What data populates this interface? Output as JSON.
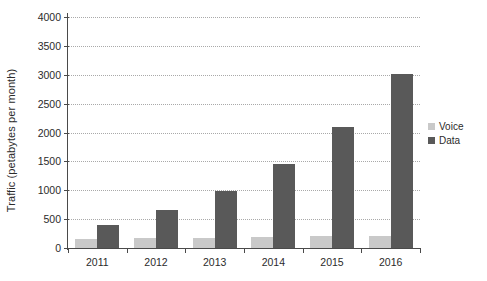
{
  "chart_data": {
    "type": "bar",
    "title": "",
    "xlabel": "",
    "ylabel": "Traffic (petabytes per month)",
    "categories": [
      "2011",
      "2012",
      "2013",
      "2014",
      "2015",
      "2016"
    ],
    "series": [
      {
        "name": "Voice",
        "color": "#c9c9c9",
        "values": [
          160,
          170,
          175,
          190,
          200,
          210
        ]
      },
      {
        "name": "Data",
        "color": "#595959",
        "values": [
          390,
          650,
          990,
          1450,
          2100,
          3020
        ]
      }
    ],
    "ylim": [
      0,
      4000
    ],
    "yticks": [
      0,
      500,
      1000,
      1500,
      2000,
      2500,
      3000,
      3500,
      4000
    ],
    "ytick_labels": [
      "0",
      "500",
      "1000",
      "1500",
      "2000",
      "2500",
      "3000",
      "3500",
      "4000"
    ],
    "grid": "horizontal-dotted",
    "legend_position": "right",
    "legend": [
      "Voice",
      "Data"
    ]
  }
}
